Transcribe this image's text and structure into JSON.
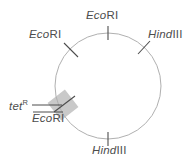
{
  "figure": {
    "type": "plasmid-restriction-map",
    "width": 193,
    "height": 162,
    "background_color": "#ffffff",
    "circle": {
      "center_x": 108,
      "center_y": 86,
      "radius": 53,
      "stroke_color": "#b3b3b3",
      "stroke_width": 1
    },
    "insert_patch": {
      "label": "shaded-insert-box",
      "fill_color": "#c9c9c9",
      "center_x": 63,
      "center_y": 105,
      "width": 22,
      "height": 22,
      "rotation_deg": -38
    },
    "tick_color": "#4d4d4d",
    "leader_color": "#4d4d4d",
    "text_color": "#4d4d4d"
  },
  "sites": [
    {
      "id": "ecori-top",
      "name_italic": "Eco",
      "name_upright": "RI",
      "full_name": "EcoRI",
      "position": "top",
      "angle_deg": 270,
      "tick_orientation": "vertical"
    },
    {
      "id": "hindiii-upper-right",
      "name_italic": "Hind",
      "name_upright": "III",
      "full_name": "HindIII",
      "position": "upper-right",
      "angle_deg": 315,
      "tick_orientation": "diagonal"
    },
    {
      "id": "ecori-upper-left",
      "name_italic": "Eco",
      "name_upright": "RI",
      "full_name": "EcoRI",
      "position": "upper-left",
      "angle_deg": 225,
      "tick_orientation": "diagonal"
    },
    {
      "id": "hindiii-bottom",
      "name_italic": "Hind",
      "name_upright": "III",
      "full_name": "HindIII",
      "position": "bottom",
      "angle_deg": 90,
      "tick_orientation": "vertical"
    },
    {
      "id": "ecori-insert",
      "name_italic": "Eco",
      "name_upright": "RI",
      "full_name": "EcoRI",
      "position": "lower-left",
      "angle_deg": 200,
      "tick_orientation": "diagonal"
    }
  ],
  "gene": {
    "id": "tet-r",
    "name_italic": "tet",
    "superscript": "R",
    "full_name": "tetR",
    "description": "tetracycline-resistance gene marker",
    "leader_line": true
  }
}
